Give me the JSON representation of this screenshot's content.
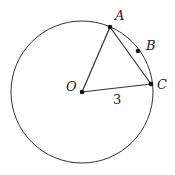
{
  "diagram": {
    "type": "circle-geometry",
    "circle": {
      "cx": 82,
      "cy": 92,
      "r": 71,
      "stroke": "#333333"
    },
    "points": {
      "O": {
        "label": "O",
        "x": 82,
        "y": 92,
        "label_x": 66,
        "label_y": 91
      },
      "A": {
        "label": "A",
        "x": 110,
        "y": 27,
        "label_x": 115,
        "label_y": 20
      },
      "B": {
        "label": "B",
        "x": 138,
        "y": 51,
        "label_x": 146,
        "label_y": 50
      },
      "C": {
        "label": "C",
        "x": 151,
        "y": 84,
        "label_x": 157,
        "label_y": 89
      }
    },
    "segments": [
      {
        "from": "O",
        "to": "A"
      },
      {
        "from": "A",
        "to": "C"
      },
      {
        "from": "O",
        "to": "C"
      }
    ],
    "length_label": {
      "text": "3",
      "segment": "O-C",
      "x": 113,
      "y": 104
    }
  }
}
